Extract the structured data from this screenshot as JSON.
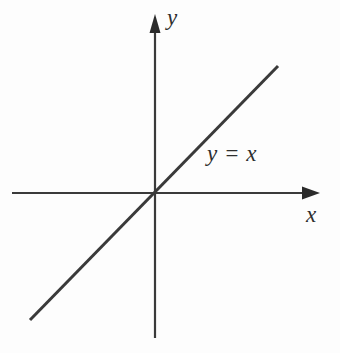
{
  "figure": {
    "type": "cartesian-plot",
    "width": 340,
    "height": 353,
    "background_color": "#fdfdfd",
    "stroke_color": "#3a3a3a",
    "text_color": "#2e2e2e"
  },
  "labels": {
    "y_axis": "y",
    "x_axis": "x",
    "line_equation": "y = x"
  },
  "chart_data": {
    "type": "line",
    "title": "",
    "subtitle": "",
    "xlabel": "x",
    "ylabel": "y",
    "grid": false,
    "legend_position": "inline-annotation",
    "axes": {
      "origin_px": [
        155,
        193
      ],
      "x_axis": {
        "label": "x",
        "start_px": [
          12,
          193
        ],
        "end_px": [
          320,
          193
        ],
        "arrow": "right",
        "ticks": [],
        "tick_labels": []
      },
      "y_axis": {
        "label": "y",
        "start_px": [
          155,
          338
        ],
        "end_px": [
          155,
          14
        ],
        "arrow": "up",
        "ticks": [],
        "tick_labels": []
      }
    },
    "series": [
      {
        "name": "y = x",
        "equation": "y = x",
        "slope": 1,
        "intercept": 0,
        "x": [
          -1,
          1
        ],
        "values": [
          -1,
          1
        ],
        "endpoints_px": [
          [
            30,
            320
          ],
          [
            278,
            66
          ]
        ],
        "annotation": "y = x",
        "annotation_px": [
          207,
          153
        ]
      }
    ]
  }
}
